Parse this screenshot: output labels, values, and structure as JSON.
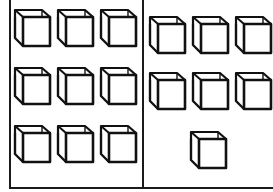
{
  "figure": {
    "stroke_color": "#111111",
    "background": "#ffffff",
    "left_group": {
      "count": 9,
      "layout": "3 rows x 3 columns",
      "cubes": [
        {
          "x": 13,
          "y": 8
        },
        {
          "x": 56,
          "y": 8
        },
        {
          "x": 99,
          "y": 8
        },
        {
          "x": 13,
          "y": 66
        },
        {
          "x": 56,
          "y": 66
        },
        {
          "x": 99,
          "y": 66
        },
        {
          "x": 13,
          "y": 124
        },
        {
          "x": 56,
          "y": 124
        },
        {
          "x": 99,
          "y": 124
        }
      ]
    },
    "right_group": {
      "count": 7,
      "layout": "2 rows x 3 columns + 1 centered",
      "cubes": [
        {
          "x": 148,
          "y": 15
        },
        {
          "x": 191,
          "y": 15
        },
        {
          "x": 234,
          "y": 15
        },
        {
          "x": 148,
          "y": 71
        },
        {
          "x": 191,
          "y": 71
        },
        {
          "x": 234,
          "y": 71
        },
        {
          "x": 189,
          "y": 130
        }
      ]
    },
    "total_cubes": 16
  }
}
